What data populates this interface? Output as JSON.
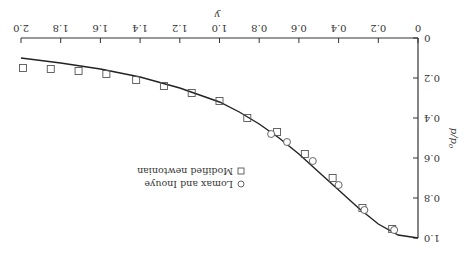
{
  "chart_data": {
    "type": "line",
    "orientation_note": "figure rendered rotated 180 degrees",
    "title": "",
    "xlabel": "y",
    "ylabel": "p/p0",
    "xlim": [
      0,
      2.0
    ],
    "ylim": [
      0,
      1.0
    ],
    "x_ticks": [
      "0",
      "0.2",
      "0.4",
      "0.6",
      "0.8",
      "1.0",
      "1.2",
      "1.4",
      "1.6",
      "1.8",
      "2.0"
    ],
    "y_ticks": [
      "0",
      "0.2",
      "0.4",
      "0.6",
      "0.8",
      "1.0"
    ],
    "grid": false,
    "legend_position": "lower left (in upright orientation)",
    "legend": [
      "Modified newtonian",
      "Lomax and Inouye"
    ],
    "series": [
      {
        "name": "Modified newtonian",
        "marker": "square",
        "x": [
          0.13,
          0.28,
          0.43,
          0.57,
          0.71,
          0.86,
          1.0,
          1.14,
          1.28,
          1.42,
          1.57,
          1.71,
          1.85,
          1.99
        ],
        "y": [
          0.955,
          0.85,
          0.7,
          0.58,
          0.47,
          0.4,
          0.315,
          0.275,
          0.24,
          0.21,
          0.18,
          0.165,
          0.155,
          0.15
        ]
      },
      {
        "name": "Lomax and Inouye",
        "marker": "circle",
        "x": [
          0.12,
          0.27,
          0.4,
          0.53,
          0.66,
          0.74
        ],
        "y": [
          0.96,
          0.86,
          0.735,
          0.615,
          0.52,
          0.48
        ]
      },
      {
        "name": "curve",
        "marker": "none",
        "x": [
          0.0,
          0.1,
          0.2,
          0.3,
          0.4,
          0.5,
          0.6,
          0.7,
          0.8,
          0.9,
          1.0,
          1.2,
          1.4,
          1.6,
          1.8,
          2.0
        ],
        "y": [
          1.0,
          0.985,
          0.93,
          0.85,
          0.76,
          0.67,
          0.58,
          0.5,
          0.43,
          0.37,
          0.32,
          0.25,
          0.195,
          0.155,
          0.125,
          0.1
        ]
      }
    ]
  }
}
